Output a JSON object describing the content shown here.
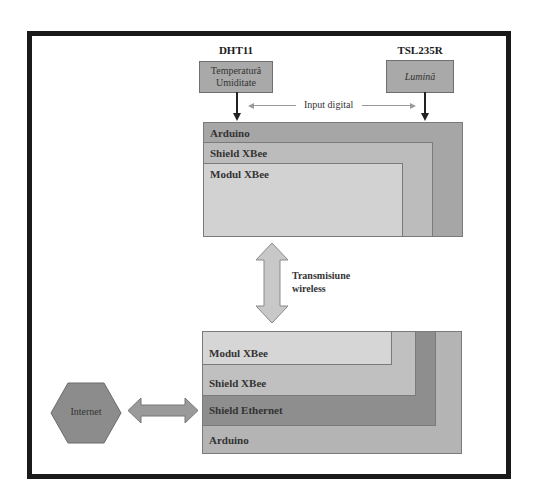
{
  "diagram": {
    "sensors": [
      {
        "name": "DHT11",
        "lines": [
          "Temperatură",
          "Umiditate"
        ]
      },
      {
        "name": "TSL235R",
        "lines": [
          "Lumină"
        ]
      }
    ],
    "input_label": "Input digital",
    "top_stack": {
      "layers": [
        {
          "label": "Arduino",
          "color": "#a6a6a6"
        },
        {
          "label": "Shield XBee",
          "color": "#bcbcbc"
        },
        {
          "label": "Modul XBee",
          "color": "#d2d2d2"
        }
      ]
    },
    "wireless_label": [
      "Transmisiune",
      "wireless"
    ],
    "bottom_stack": {
      "layers": [
        {
          "label": "Modul XBee",
          "color": "#d6d6d6"
        },
        {
          "label": "Shield XBee",
          "color": "#c0c0c0"
        },
        {
          "label": "Shield Ethernet",
          "color": "#8e8e8e"
        },
        {
          "label": "Arduino",
          "color": "#b4b4b4"
        }
      ]
    },
    "internet_label": "Internet",
    "colors": {
      "frame": "#1a1a1a",
      "sensor_fill": "#a9a9a9",
      "arrow_fill": "#c8c8c8",
      "hexagon_fill": "#8c8c8c",
      "double_arrow_fill": "#9a9a9a"
    }
  }
}
